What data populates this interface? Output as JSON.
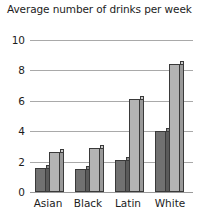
{
  "chart_data": {
    "type": "bar",
    "title": "Average number of drinks per week",
    "xlabel": "",
    "ylabel": "",
    "ylim": [
      0,
      10
    ],
    "yticks": [
      0,
      2,
      4,
      6,
      8,
      10
    ],
    "grid": true,
    "legend": "none",
    "categories": [
      "Asian",
      "Black",
      "Latin",
      "White"
    ],
    "series": [
      {
        "name": "series-1-dark",
        "color": "#717171",
        "values": [
          1.6,
          1.5,
          2.1,
          4.0
        ]
      },
      {
        "name": "series-2-light",
        "color": "#b4b4b4",
        "values": [
          2.6,
          2.9,
          6.1,
          8.4
        ]
      }
    ]
  },
  "axis": {
    "ytick_labels": [
      "10",
      "8",
      "6",
      "4",
      "2",
      "0"
    ],
    "xtick_labels": [
      "Asian",
      "Black",
      "Latin",
      "White"
    ]
  }
}
